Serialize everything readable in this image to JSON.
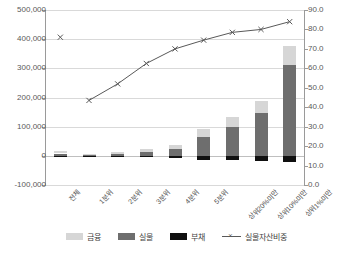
{
  "chart_data": {
    "type": "bar",
    "title": "",
    "subtitle": "",
    "xlabel": "",
    "ylabel": "",
    "y2label": "",
    "grid": true,
    "legend_position": "bottom",
    "categories": [
      "전체",
      "1분위",
      "2분위",
      "3분위",
      "4분위",
      "5분위",
      "상위20%미만",
      "상위10%미만",
      "상위1%미만"
    ],
    "ylim": [
      -100000,
      500000
    ],
    "yticks": [
      "-100,000",
      "0",
      "100,000",
      "200,000",
      "300,000",
      "400,000",
      "500,000"
    ],
    "ytick_values": [
      -100000,
      0,
      100000,
      200000,
      300000,
      400000,
      500000
    ],
    "y2lim": [
      0,
      90
    ],
    "y2ticks": [
      "0.0",
      "10.0",
      "20.0",
      "30.0",
      "40.0",
      "50.0",
      "60.0",
      "70.0",
      "80.0",
      "90.0"
    ],
    "y2tick_values": [
      0,
      10,
      20,
      30,
      40,
      50,
      60,
      70,
      80,
      90
    ],
    "series": [
      {
        "name": "금융",
        "type": "bar-stack",
        "color": "#d6d6d6",
        "values": [
          9500,
          3200,
          5500,
          9000,
          14000,
          28000,
          32000,
          42000,
          68000
        ]
      },
      {
        "name": "실물",
        "type": "bar-stack",
        "color": "#6e6e6e",
        "values": [
          8000,
          1500,
          6000,
          14000,
          24000,
          64000,
          100000,
          146000,
          310000
        ]
      },
      {
        "name": "부채",
        "type": "bar-stack-negative",
        "color": "#101010",
        "values": [
          -2500,
          -600,
          -2000,
          -4500,
          -7500,
          -13000,
          -15000,
          -17000,
          -21000
        ]
      },
      {
        "name": "실물자산비중",
        "type": "line",
        "color": "#595959",
        "marker": "x",
        "axis": "secondary",
        "values": [
          76.0,
          43.5,
          52.0,
          62.5,
          70.0,
          74.5,
          78.5,
          80.0,
          84.0
        ]
      }
    ]
  },
  "legend": {
    "items": [
      {
        "label": "금융",
        "swatch": "#d6d6d6",
        "kind": "swatch"
      },
      {
        "label": "실물",
        "swatch": "#6e6e6e",
        "kind": "swatch"
      },
      {
        "label": "부채",
        "swatch": "#101010",
        "kind": "swatch"
      },
      {
        "label": "실물자산비중",
        "swatch": "#595959",
        "kind": "line"
      }
    ]
  }
}
